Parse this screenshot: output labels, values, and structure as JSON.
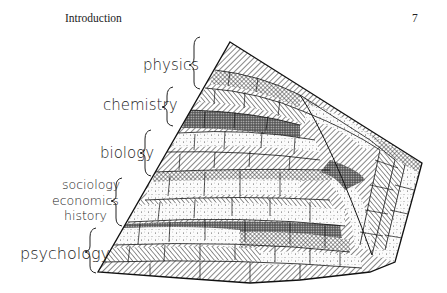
{
  "page": {
    "running_head": "Introduction",
    "page_number": "7"
  },
  "figure": {
    "labels": [
      {
        "id": "physics",
        "text": "physics"
      },
      {
        "id": "chemistry",
        "text": "chemistry"
      },
      {
        "id": "biology",
        "text": "biology"
      },
      {
        "id": "sociology",
        "text": "sociology"
      },
      {
        "id": "economics",
        "text": "economics"
      },
      {
        "id": "history",
        "text": "history"
      },
      {
        "id": "psychology",
        "text": "psychology"
      }
    ],
    "colors": {
      "ink": "#1a1a1a",
      "paper": "#ffffff"
    }
  }
}
